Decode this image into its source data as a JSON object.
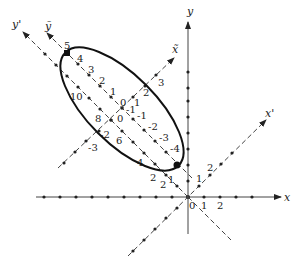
{
  "diagram": {
    "axes": {
      "x": {
        "label": "x",
        "ticks": [
          "0",
          "1",
          "2"
        ]
      },
      "y": {
        "label": "y"
      },
      "x_prime": {
        "label": "x'",
        "ticks": [
          "1",
          "2"
        ]
      },
      "y_prime": {
        "label": "y'",
        "ticks": [
          "2",
          "4",
          "6",
          "8",
          "10"
        ]
      },
      "x_tilde": {
        "label": "x̃",
        "ticks": [
          "-3",
          "-2",
          "-1",
          "0",
          "1",
          "2",
          "3"
        ]
      },
      "y_tilde": {
        "label": "ỹ",
        "ticks": [
          "-4",
          "-3",
          "-2",
          "-1",
          "0",
          "1",
          "2",
          "3",
          "4",
          "5"
        ]
      }
    },
    "extra_labels": [
      "1",
      "2"
    ],
    "colors": {
      "ink": "#222222",
      "background": "#ffffff"
    }
  }
}
